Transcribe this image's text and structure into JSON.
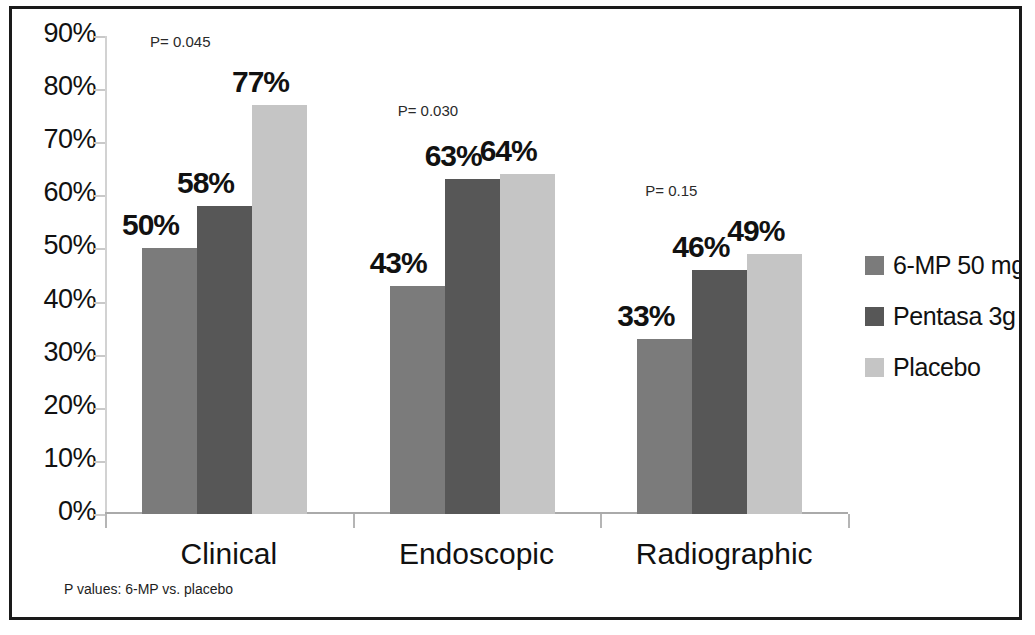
{
  "chart_data": {
    "type": "bar",
    "title": "",
    "xlabel": "",
    "ylabel": "",
    "ylim": [
      0,
      90
    ],
    "grid": false,
    "legend_position": "right",
    "categories": [
      "Clinical",
      "Endoscopic",
      "Radiographic"
    ],
    "ytick_labels": [
      "90%",
      "80%",
      "70%",
      "60%",
      "50%",
      "40%",
      "30%",
      "20%",
      "10%",
      "0%"
    ],
    "ytick_values": [
      90,
      80,
      70,
      60,
      50,
      40,
      30,
      20,
      10,
      0
    ],
    "series": [
      {
        "name": "6-MP 50 mg",
        "color": "#7b7b7b",
        "values": [
          50,
          43,
          33
        ],
        "value_labels": [
          "50%",
          "43%",
          "33%"
        ]
      },
      {
        "name": "Pentasa 3g",
        "color": "#575757",
        "values": [
          58,
          63,
          46
        ],
        "value_labels": [
          "58%",
          "63%",
          "46%"
        ]
      },
      {
        "name": "Placebo",
        "color": "#c5c5c5",
        "values": [
          77,
          64,
          49
        ],
        "value_labels": [
          "77%",
          "64%",
          "49%"
        ]
      }
    ],
    "annotations": [
      {
        "text": "P= 0.045",
        "category": "Clinical"
      },
      {
        "text": "P= 0.030",
        "category": "Endoscopic"
      },
      {
        "text": "P= 0.15",
        "category": "Radiographic"
      }
    ],
    "footnote": "P values: 6-MP vs. placebo"
  },
  "legend": {
    "items": [
      {
        "label": "6-MP 50 mg",
        "color": "#7b7b7b"
      },
      {
        "label": "Pentasa 3g",
        "color": "#575757"
      },
      {
        "label": "Placebo",
        "color": "#c5c5c5"
      }
    ]
  },
  "footnote": {
    "text": "P values: 6-MP vs. placebo"
  },
  "axes": {
    "y_labels": [
      "90%",
      "80%",
      "70%",
      "60%",
      "50%",
      "40%",
      "30%",
      "20%",
      "10%",
      "0%"
    ],
    "x_labels": [
      "Clinical",
      "Endoscopic",
      "Radiographic"
    ]
  }
}
